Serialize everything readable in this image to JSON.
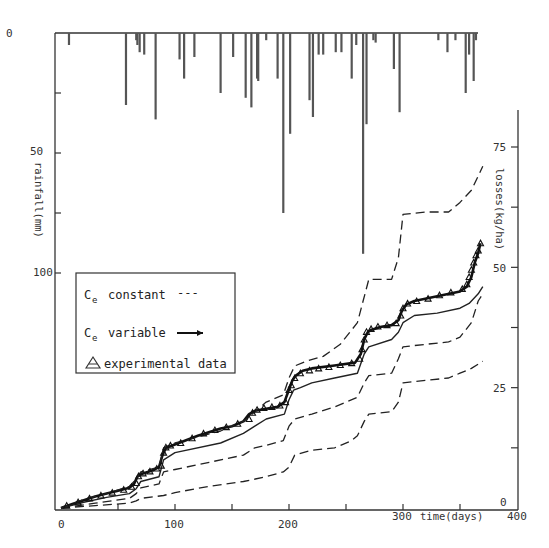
{
  "chart_data": {
    "type": "line",
    "title": "",
    "xlabel": "time(days)",
    "ylabel_left": "rainfall(mm)",
    "ylabel_right": "losses(kg/ha)",
    "xlim": [
      0,
      400
    ],
    "ylim_left": [
      0,
      100
    ],
    "ylim_left_inverted": true,
    "ylim_right": [
      0,
      75
    ],
    "x_ticks": [
      0,
      100,
      200,
      300,
      400
    ],
    "x_tick_labels": [
      "0",
      "100",
      "200",
      "300",
      "400"
    ],
    "x_minor_ticks": [
      50,
      150,
      250,
      350
    ],
    "left_ticks": [
      0,
      50,
      100
    ],
    "left_tick_labels": [
      "0",
      "50",
      "100"
    ],
    "left_minor_ticks": [
      25,
      75
    ],
    "right_ticks": [
      0,
      25,
      50,
      75
    ],
    "right_tick_labels": [
      "0",
      "25",
      "50",
      "75"
    ],
    "right_minor_ticks": [
      12.5,
      37.5,
      62.5
    ],
    "grid": false,
    "legend": {
      "placement": "center-left",
      "entries": [
        {
          "symbol": "C",
          "subscript": "e",
          "label": "constant",
          "marker": "---"
        },
        {
          "symbol": "C",
          "subscript": "e",
          "label": "variable",
          "marker": "line-with-dots"
        },
        {
          "symbol": "triangle",
          "subscript": "",
          "label": "experimental data",
          "marker": ""
        }
      ]
    },
    "rainfall": {
      "name": "rainfall",
      "axis": "left",
      "bars": [
        {
          "day": 7,
          "mm": 5
        },
        {
          "day": 57,
          "mm": 30
        },
        {
          "day": 66,
          "mm": 3
        },
        {
          "day": 67,
          "mm": 5
        },
        {
          "day": 69,
          "mm": 8
        },
        {
          "day": 73,
          "mm": 9
        },
        {
          "day": 83,
          "mm": 36
        },
        {
          "day": 104,
          "mm": 11
        },
        {
          "day": 108,
          "mm": 19
        },
        {
          "day": 117,
          "mm": 10
        },
        {
          "day": 140,
          "mm": 25
        },
        {
          "day": 151,
          "mm": 10
        },
        {
          "day": 162,
          "mm": 27
        },
        {
          "day": 167,
          "mm": 31
        },
        {
          "day": 172,
          "mm": 19
        },
        {
          "day": 173,
          "mm": 20
        },
        {
          "day": 180,
          "mm": 3
        },
        {
          "day": 190,
          "mm": 19
        },
        {
          "day": 195,
          "mm": 75
        },
        {
          "day": 201,
          "mm": 42
        },
        {
          "day": 218,
          "mm": 28
        },
        {
          "day": 221,
          "mm": 35
        },
        {
          "day": 226,
          "mm": 9
        },
        {
          "day": 230,
          "mm": 9
        },
        {
          "day": 241,
          "mm": 8
        },
        {
          "day": 246,
          "mm": 8
        },
        {
          "day": 255,
          "mm": 19
        },
        {
          "day": 259,
          "mm": 5
        },
        {
          "day": 265,
          "mm": 92
        },
        {
          "day": 268,
          "mm": 38
        },
        {
          "day": 274,
          "mm": 3
        },
        {
          "day": 276,
          "mm": 4
        },
        {
          "day": 292,
          "mm": 15
        },
        {
          "day": 297,
          "mm": 33
        },
        {
          "day": 331,
          "mm": 3
        },
        {
          "day": 339,
          "mm": 8
        },
        {
          "day": 346,
          "mm": 3
        },
        {
          "day": 355,
          "mm": 25
        },
        {
          "day": 358,
          "mm": 9
        },
        {
          "day": 362,
          "mm": 20
        },
        {
          "day": 364,
          "mm": 3
        }
      ]
    },
    "series": [
      {
        "name": "Ce variable",
        "style": "solid-with-markers",
        "axis": "right",
        "x": [
          0,
          10,
          20,
          30,
          40,
          50,
          60,
          64,
          67,
          70,
          80,
          86,
          89,
          92,
          100,
          120,
          140,
          150,
          160,
          165,
          170,
          180,
          190,
          196,
          199,
          203,
          206,
          212,
          220,
          240,
          258,
          263,
          266,
          269,
          272,
          280,
          290,
          296,
          299,
          303,
          310,
          330,
          350,
          356,
          360,
          363,
          366,
          368
        ],
        "y": [
          0,
          0.8,
          1.6,
          2.4,
          3.0,
          3.6,
          4.2,
          5,
          6.5,
          7,
          7.8,
          8.5,
          11,
          12.5,
          13.2,
          15,
          16.5,
          17,
          18,
          19.5,
          20.2,
          20.6,
          21,
          22,
          24,
          26.5,
          27.5,
          28.5,
          29,
          29.6,
          30.2,
          32,
          35,
          36.5,
          37,
          37.6,
          38,
          39,
          41,
          42.3,
          43,
          44,
          45,
          46,
          48,
          51,
          53,
          55
        ]
      },
      {
        "name": "Ce constant (middle)",
        "style": "solid",
        "axis": "right",
        "x": [
          0,
          20,
          40,
          60,
          66,
          70,
          86,
          90,
          100,
          140,
          160,
          170,
          180,
          196,
          200,
          204,
          210,
          220,
          240,
          260,
          266,
          270,
          290,
          296,
          300,
          310,
          330,
          350,
          358,
          366,
          370
        ],
        "y": [
          0,
          1.2,
          2.2,
          3.0,
          4.0,
          5.5,
          6.5,
          10.0,
          11.5,
          13.5,
          15.5,
          17.0,
          18.5,
          19.5,
          22.5,
          24.5,
          25.0,
          26.0,
          27.0,
          28.0,
          32.0,
          33.5,
          35.0,
          36.5,
          38.5,
          40.0,
          40.5,
          41.5,
          42.5,
          44.5,
          46.0
        ]
      },
      {
        "name": "Ce constant (upper bound)",
        "style": "dashed",
        "axis": "right",
        "x": [
          0,
          20,
          40,
          60,
          66,
          70,
          86,
          90,
          100,
          140,
          160,
          170,
          180,
          195,
          200,
          205,
          215,
          230,
          245,
          260,
          265,
          270,
          290,
          296,
          300,
          320,
          340,
          350,
          360,
          370
        ],
        "y": [
          0,
          1.8,
          3.0,
          4.5,
          6.0,
          7.5,
          8.5,
          12.5,
          13.5,
          16.0,
          18.0,
          20.0,
          22.0,
          23.5,
          27.0,
          29.5,
          30.5,
          31.5,
          34.0,
          38.5,
          43.0,
          47.5,
          47.5,
          52.0,
          61.0,
          61.5,
          61.5,
          63.5,
          66.0,
          71.0
        ]
      },
      {
        "name": "Ce constant (lower bound)",
        "style": "dashed",
        "axis": "right",
        "x": [
          0,
          30,
          60,
          66,
          70,
          86,
          90,
          100,
          130,
          160,
          170,
          180,
          195,
          200,
          205,
          220,
          240,
          260,
          266,
          270,
          290,
          296,
          300,
          320,
          340,
          350,
          360,
          366,
          370
        ],
        "y": [
          0,
          1.0,
          2.0,
          3.0,
          4.2,
          5.0,
          7.5,
          8.0,
          9.5,
          11.0,
          12.5,
          13.0,
          14.0,
          17.0,
          18.5,
          19.5,
          21.0,
          23.0,
          26.0,
          27.5,
          28.0,
          31.0,
          33.5,
          34.0,
          34.5,
          35.5,
          38.5,
          43.0,
          44.5
        ]
      },
      {
        "name": "Ce constant (lowest)",
        "style": "dashed",
        "axis": "right",
        "x": [
          0,
          30,
          60,
          66,
          70,
          90,
          100,
          130,
          160,
          180,
          195,
          200,
          205,
          220,
          240,
          255,
          260,
          266,
          270,
          290,
          296,
          300,
          320,
          340,
          350,
          360,
          370
        ],
        "y": [
          0,
          0.5,
          1.0,
          1.5,
          2.0,
          2.6,
          3.2,
          4.5,
          5.5,
          6.5,
          7.5,
          8.5,
          11.0,
          12.0,
          12.5,
          14.0,
          15.0,
          18.0,
          19.5,
          20.0,
          22.0,
          26.0,
          26.5,
          27.0,
          28.0,
          29.0,
          30.5
        ]
      }
    ],
    "experimental_data": {
      "name": "experimental data",
      "marker": "triangle",
      "axis": "right",
      "x": [
        5,
        15,
        25,
        35,
        45,
        55,
        62,
        66,
        68,
        72,
        78,
        84,
        88,
        90,
        92,
        96,
        105,
        115,
        125,
        135,
        145,
        155,
        165,
        168,
        172,
        178,
        185,
        192,
        197,
        200,
        202,
        205,
        210,
        218,
        226,
        235,
        245,
        255,
        262,
        264,
        266,
        268,
        272,
        278,
        286,
        294,
        298,
        300,
        304,
        312,
        322,
        332,
        342,
        352,
        356,
        358,
        360,
        362,
        364,
        366,
        368
      ],
      "y": [
        0.5,
        1.2,
        2.0,
        2.6,
        3.2,
        3.8,
        4.4,
        5.2,
        6.6,
        7.2,
        7.6,
        8.2,
        8.8,
        11.5,
        12.6,
        13.0,
        13.5,
        14.5,
        15.5,
        16.2,
        16.8,
        17.5,
        18.5,
        19.8,
        20.4,
        20.8,
        21.0,
        21.3,
        22.0,
        24.5,
        25.5,
        27.0,
        28.0,
        28.6,
        29.0,
        29.3,
        29.7,
        30.1,
        31.0,
        33.0,
        35.0,
        36.6,
        37.2,
        37.7,
        38.0,
        38.4,
        40.0,
        41.5,
        42.5,
        43.0,
        43.5,
        44.2,
        44.8,
        45.5,
        46.5,
        48.0,
        49.5,
        51.0,
        52.5,
        53.5,
        55.0
      ]
    }
  }
}
